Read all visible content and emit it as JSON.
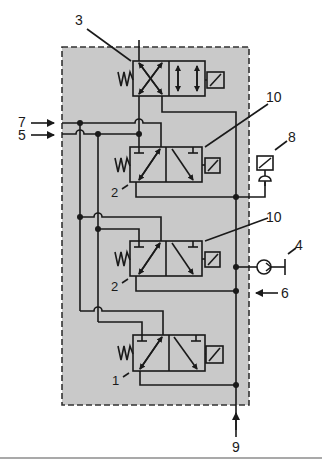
{
  "diagram": {
    "colors": {
      "housing_fill": "#c9c9c9",
      "line": "#1a1a1a",
      "background": "#ffffff"
    },
    "callouts": {
      "c3": "3",
      "c10a": "10",
      "c10b": "10",
      "c8": "8",
      "c7": "7",
      "c5": "5",
      "c2a": "2",
      "c2b": "2",
      "c4": "4",
      "c6": "6",
      "c1": "1",
      "c9": "9"
    },
    "components": [
      {
        "id": "3",
        "type": "4/2 solenoid valve, spring return"
      },
      {
        "id": "2",
        "type": "3/2 solenoid valve, spring return (upper)"
      },
      {
        "id": "2",
        "type": "3/2 solenoid valve, spring return (lower)"
      },
      {
        "id": "1",
        "type": "3/2 solenoid valve, spring return"
      },
      {
        "id": "8",
        "type": "pressure switch"
      },
      {
        "id": "4",
        "type": "check valve / restrictor"
      },
      {
        "id": "10",
        "type": "solenoid"
      }
    ],
    "ports": [
      {
        "id": "7",
        "direction": "in",
        "side": "left"
      },
      {
        "id": "5",
        "direction": "in",
        "side": "left"
      },
      {
        "id": "6",
        "direction": "in",
        "side": "right"
      },
      {
        "id": "9",
        "direction": "in",
        "side": "bottom"
      }
    ]
  }
}
